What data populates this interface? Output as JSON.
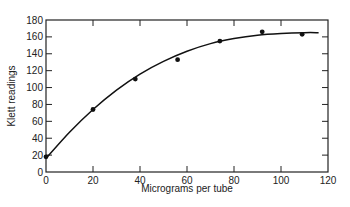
{
  "chart_data": {
    "type": "scatter",
    "title": "",
    "xlabel": "Micrograms per tube",
    "ylabel": "Klett readings",
    "xlim": [
      0,
      120
    ],
    "ylim": [
      0,
      180
    ],
    "xticks": [
      0,
      20,
      40,
      60,
      80,
      100,
      120
    ],
    "yticks": [
      0,
      20,
      40,
      60,
      80,
      100,
      120,
      140,
      160,
      180
    ],
    "grid": false,
    "legend": null,
    "series": [
      {
        "name": "measured",
        "type": "scatter",
        "points": [
          [
            0,
            18
          ],
          [
            20,
            74
          ],
          [
            38,
            110
          ],
          [
            56,
            133
          ],
          [
            74,
            155
          ],
          [
            92,
            166
          ],
          [
            109,
            163
          ]
        ]
      },
      {
        "name": "fitted curve",
        "type": "line",
        "points": [
          [
            0,
            16
          ],
          [
            10,
            47
          ],
          [
            20,
            74
          ],
          [
            30,
            97
          ],
          [
            40,
            116
          ],
          [
            50,
            131
          ],
          [
            60,
            143
          ],
          [
            70,
            152
          ],
          [
            80,
            158
          ],
          [
            90,
            162
          ],
          [
            100,
            164
          ],
          [
            110,
            165
          ],
          [
            116,
            165
          ]
        ]
      }
    ]
  }
}
